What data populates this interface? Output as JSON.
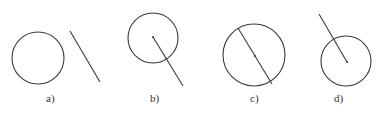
{
  "diagram": {
    "stroke_color": "#3a3a3a",
    "background": "#ffffff",
    "figures": [
      {
        "id": "a",
        "label": "a)",
        "label_pos": {
          "x": 46,
          "y": 102
        },
        "circle": {
          "cx": 38,
          "cy": 58,
          "r": 26
        },
        "line": {
          "x1": 70,
          "y1": 31,
          "x2": 100,
          "y2": 82
        },
        "center_dot": null,
        "relation": "line separate from circle"
      },
      {
        "id": "b",
        "label": "b)",
        "label_pos": {
          "x": 150,
          "y": 102
        },
        "circle": {
          "cx": 153,
          "cy": 38,
          "r": 25
        },
        "line": {
          "x1": 153,
          "y1": 37,
          "x2": 183,
          "y2": 86
        },
        "center_dot": {
          "cx": 153,
          "cy": 37
        },
        "relation": "radius extended outside circle"
      },
      {
        "id": "c",
        "label": "c)",
        "label_pos": {
          "x": 250,
          "y": 102
        },
        "circle": {
          "cx": 254,
          "cy": 55,
          "r": 31
        },
        "line": {
          "x1": 238,
          "y1": 28,
          "x2": 272,
          "y2": 84
        },
        "center_dot": {
          "cx": 255,
          "cy": 56
        },
        "relation": "diameter"
      },
      {
        "id": "d",
        "label": "d)",
        "label_pos": {
          "x": 334,
          "y": 102
        },
        "circle": {
          "cx": 346,
          "cy": 61,
          "r": 25
        },
        "line": {
          "x1": 319,
          "y1": 14,
          "x2": 347,
          "y2": 62
        },
        "center_dot": {
          "cx": 347,
          "cy": 62
        },
        "relation": "radius extended outside circle (upward)"
      }
    ]
  }
}
